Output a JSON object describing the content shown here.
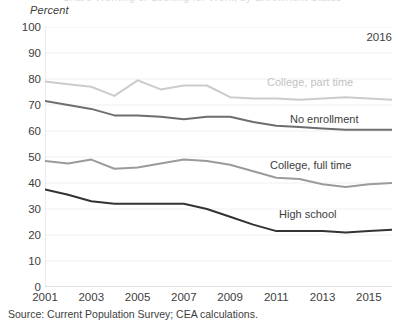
{
  "clipped_title": "Share Working or Looking for Work, by Enrollment Status",
  "y_axis_title": "Percent",
  "year_annotation": "2016",
  "source_note": "Source: Current Population Survey; CEA calculations.",
  "colors": {
    "college_part_time": "#cccccc",
    "no_enrollment": "#6e6e6e",
    "college_full_time": "#9b9b9b",
    "high_school": "#333333",
    "gridline": "#f0f0f0",
    "axis": "#d9d9d9",
    "text": "#3d3d3d"
  },
  "labels": {
    "college_part_time": "College, part time",
    "no_enrollment": "No enrollment",
    "college_full_time": "College, full time",
    "high_school": "High school"
  },
  "chart_data": {
    "type": "line",
    "title": "Share Working or Looking for Work, by Enrollment Status",
    "xlabel": "",
    "ylabel": "Percent",
    "ylim": [
      0,
      100
    ],
    "xlim": [
      2001,
      2016
    ],
    "ytick_labels": [
      "0",
      "10",
      "20",
      "30",
      "40",
      "50",
      "60",
      "70",
      "80",
      "90",
      "100"
    ],
    "ytick_values": [
      0,
      10,
      20,
      30,
      40,
      50,
      60,
      70,
      80,
      90,
      100
    ],
    "xtick_labels": [
      "2001",
      "2003",
      "2005",
      "2007",
      "2009",
      "2011",
      "2013",
      "2015"
    ],
    "xtick_values": [
      2001,
      2003,
      2005,
      2007,
      2009,
      2011,
      2013,
      2015
    ],
    "grid": true,
    "legend_position": "inline-right",
    "annotations": [
      {
        "text": "2016",
        "position": "top-right"
      }
    ],
    "x": [
      2001,
      2002,
      2003,
      2004,
      2005,
      2006,
      2007,
      2008,
      2009,
      2010,
      2011,
      2012,
      2013,
      2014,
      2015,
      2016
    ],
    "series": [
      {
        "name": "College, part time",
        "color": "#cccccc",
        "values": [
          79.0,
          78.0,
          77.0,
          73.5,
          79.5,
          76.0,
          77.5,
          77.5,
          73.0,
          72.5,
          72.5,
          72.0,
          72.5,
          73.0,
          72.5,
          72.0
        ]
      },
      {
        "name": "No enrollment",
        "color": "#6e6e6e",
        "values": [
          71.5,
          70.0,
          68.5,
          66.0,
          66.0,
          65.5,
          64.5,
          65.5,
          65.5,
          63.5,
          62.0,
          61.5,
          61.0,
          60.5,
          60.5,
          60.5
        ]
      },
      {
        "name": "College, full time",
        "color": "#9b9b9b",
        "values": [
          48.5,
          47.5,
          49.0,
          45.5,
          46.0,
          47.5,
          49.0,
          48.5,
          47.0,
          44.5,
          42.0,
          41.5,
          39.5,
          38.5,
          39.5,
          40.0
        ]
      },
      {
        "name": "High school",
        "color": "#333333",
        "values": [
          37.5,
          35.5,
          33.0,
          32.0,
          32.0,
          32.0,
          32.0,
          30.0,
          27.0,
          24.0,
          21.5,
          21.5,
          21.5,
          21.0,
          21.5,
          22.0
        ]
      }
    ]
  }
}
